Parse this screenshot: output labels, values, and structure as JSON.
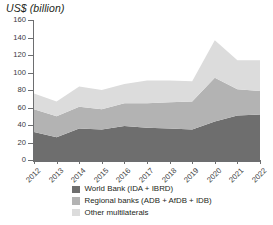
{
  "chart_data": {
    "type": "area",
    "stacked": true,
    "title": "US$ (billion)",
    "xlabel": "",
    "ylabel": "US$ (billion)",
    "x": [
      "2012",
      "2013",
      "2014",
      "2015",
      "2016",
      "2017",
      "2018",
      "2019",
      "2020",
      "2021",
      "2022"
    ],
    "categories": [
      "2012",
      "2013",
      "2014",
      "2015",
      "2016",
      "2017",
      "2018",
      "2019",
      "2020",
      "2021",
      "2022"
    ],
    "ylim": [
      0,
      160
    ],
    "yticks": [
      0,
      20,
      40,
      60,
      80,
      100,
      120,
      140,
      160
    ],
    "grid": false,
    "legend_position": "bottom",
    "series": [
      {
        "name": "World Bank (IDA + IBRD)",
        "color": "#6e6e6e",
        "values": [
          32,
          26,
          36,
          35,
          39,
          37,
          36,
          35,
          44,
          51,
          52
        ]
      },
      {
        "name": "Regional banks (ADB + AfDB + IDB)",
        "color": "#b3b3b3",
        "values": [
          26,
          24,
          25,
          23,
          26,
          28,
          30,
          32,
          50,
          30,
          27
        ]
      },
      {
        "name": "Other multilaterals",
        "color": "#dcdcdc",
        "values": [
          18,
          17,
          23,
          22,
          22,
          26,
          25,
          23,
          43,
          33,
          35
        ]
      }
    ],
    "totals": [
      76,
      67,
      84,
      80,
      87,
      91,
      91,
      90,
      137,
      114,
      114
    ]
  },
  "legend": {
    "items": [
      {
        "label": "World Bank (IDA + IBRD)",
        "color": "#6e6e6e"
      },
      {
        "label": "Regional banks (ADB + AfDB + IDB)",
        "color": "#b3b3b3"
      },
      {
        "label": "Other multilaterals",
        "color": "#dcdcdc"
      }
    ]
  },
  "axes": {
    "y_title": "US$ (billion)",
    "y_tick_labels": [
      "0",
      "20",
      "40",
      "60",
      "80",
      "100",
      "120",
      "140",
      "160"
    ],
    "x_tick_labels": [
      "2012",
      "2013",
      "2014",
      "2015",
      "2016",
      "2017",
      "2018",
      "2019",
      "2020",
      "2021",
      "2022"
    ]
  },
  "colors": {
    "axis": "#6d6e70",
    "text": "#231f20",
    "series_dark": "#6e6e6e",
    "series_mid": "#b3b3b3",
    "series_light": "#dcdcdc"
  }
}
